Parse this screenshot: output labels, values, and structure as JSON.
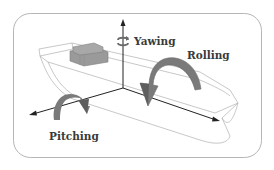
{
  "diagram": {
    "labels": {
      "yawing": "Yawing",
      "rolling": "Rolling",
      "pitching": "Pitching"
    },
    "colors": {
      "frame": "#b5b5b5",
      "hull_outline": "#b0b0b0",
      "axis": "#222222",
      "arrow_fill": "#7a7a7a",
      "arrow_dark": "#5e5e5e",
      "cabin": "#9a9a9a",
      "text": "#3a3a3a"
    }
  }
}
